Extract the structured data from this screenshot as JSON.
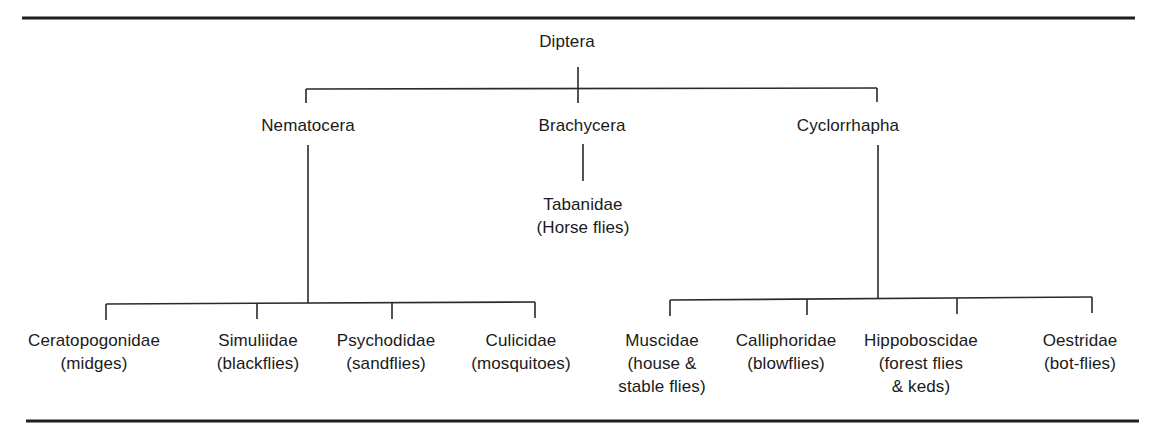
{
  "diagram": {
    "type": "taxonomy-tree",
    "root": {
      "label": "Diptera"
    },
    "suborders": [
      {
        "label": "Nematocera",
        "families": [
          {
            "name": "Ceratopogonidae",
            "common": [
              "(midges)"
            ]
          },
          {
            "name": "Simuliidae",
            "common": [
              "(blackflies)"
            ]
          },
          {
            "name": "Psychodidae",
            "common": [
              "(sandflies)"
            ]
          },
          {
            "name": "Culicidae",
            "common": [
              "(mosquitoes)"
            ]
          }
        ]
      },
      {
        "label": "Brachycera",
        "families": [
          {
            "name": "Tabanidae",
            "common": [
              "(Horse flies)"
            ]
          }
        ]
      },
      {
        "label": "Cyclorrhapha",
        "families": [
          {
            "name": "Muscidae",
            "common": [
              "(house &",
              "stable flies)"
            ]
          },
          {
            "name": "Calliphoridae",
            "common": [
              "(blowflies)"
            ]
          },
          {
            "name": "Hippoboscidae",
            "common": [
              "(forest flies",
              "& keds)"
            ]
          },
          {
            "name": "Oestridae",
            "common": [
              "(bot-flies)"
            ]
          }
        ]
      }
    ],
    "colors": {
      "line": "#2a2a2a",
      "rule": "#1f1f1f",
      "text": "#1a1a1a",
      "background": "#ffffff"
    }
  }
}
